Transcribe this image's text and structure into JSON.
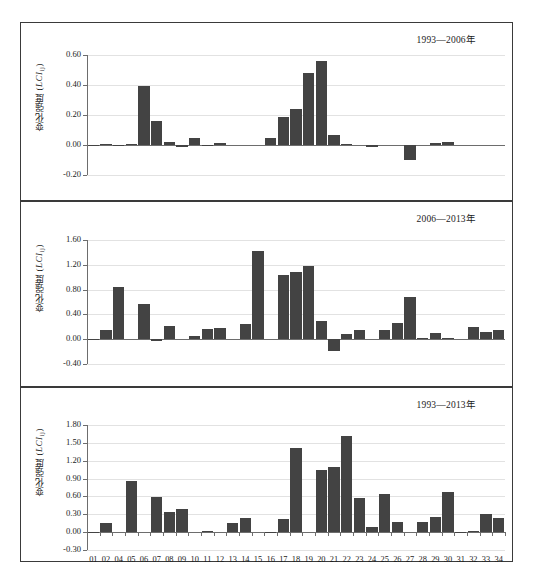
{
  "figure": {
    "ylabel": "变化强度 (LCIij)",
    "ylabel_main": "变化强度 (",
    "ylabel_ital": "LCI",
    "ylabel_sub": "ij",
    "ylabel_end": ")"
  },
  "chart_data": [
    {
      "type": "bar",
      "title": "1993—2006年",
      "xlabel": "",
      "ylabel": "变化强度 (LCIij)",
      "ylim": [
        -0.2,
        0.6
      ],
      "yticks": [
        "0.60",
        "0.40",
        "0.20",
        "0.00",
        "-0.20"
      ],
      "ytick_values": [
        0.6,
        0.4,
        0.2,
        0.0,
        -0.2
      ],
      "grid": true,
      "legend": "none",
      "categories": [
        "01",
        "02",
        "04",
        "05",
        "06",
        "07",
        "08",
        "09",
        "10",
        "11",
        "12",
        "13",
        "14",
        "15",
        "16",
        "17",
        "18",
        "19",
        "20",
        "21",
        "22",
        "23",
        "24",
        "25",
        "26",
        "27",
        "28",
        "29",
        "30",
        "31",
        "32",
        "33",
        "34"
      ],
      "values": [
        -0.002,
        0.006,
        -0.003,
        0.004,
        0.392,
        0.16,
        0.018,
        -0.012,
        0.046,
        -0.004,
        0.012,
        0.0,
        0.0,
        0.0,
        0.05,
        0.185,
        0.24,
        0.48,
        0.557,
        0.068,
        0.004,
        0.0,
        -0.015,
        0.0,
        0.0,
        -0.1,
        0.0,
        0.014,
        0.022,
        0.0,
        0.0,
        0.0,
        0.0
      ]
    },
    {
      "type": "bar",
      "title": "2006—2013年",
      "xlabel": "",
      "ylabel": "变化强度 (LCIij)",
      "ylim": [
        -0.4,
        1.6
      ],
      "yticks": [
        "1.60",
        "1.20",
        "0.80",
        "0.40",
        "0.00",
        "-0.40"
      ],
      "ytick_values": [
        1.6,
        1.2,
        0.8,
        0.4,
        0.0,
        -0.4
      ],
      "grid": true,
      "legend": "none",
      "categories": [
        "01",
        "02",
        "04",
        "05",
        "06",
        "07",
        "08",
        "09",
        "10",
        "11",
        "12",
        "13",
        "14",
        "15",
        "16",
        "17",
        "18",
        "19",
        "20",
        "21",
        "22",
        "23",
        "24",
        "25",
        "26",
        "27",
        "28",
        "29",
        "30",
        "31",
        "32",
        "33",
        "34"
      ],
      "values": [
        -0.01,
        0.145,
        0.845,
        0.0,
        0.575,
        -0.03,
        0.205,
        0.0,
        0.055,
        0.165,
        0.185,
        0.0,
        0.24,
        1.43,
        0.0,
        1.03,
        1.085,
        1.18,
        0.295,
        -0.19,
        0.09,
        0.15,
        0.0,
        0.145,
        0.26,
        0.68,
        0.02,
        0.105,
        0.02,
        0.0,
        0.19,
        0.11,
        0.15
      ]
    },
    {
      "type": "bar",
      "title": "1993—2013年",
      "xlabel": "",
      "ylabel": "变化强度 (LCIij)",
      "ylim": [
        -0.3,
        1.8
      ],
      "yticks": [
        "1.80",
        "1.50",
        "1.20",
        "0.90",
        "0.60",
        "0.30",
        "0.00",
        "-0.30"
      ],
      "ytick_values": [
        1.8,
        1.5,
        1.2,
        0.9,
        0.6,
        0.3,
        0.0,
        -0.3
      ],
      "grid": true,
      "legend": "none",
      "categories": [
        "01",
        "02",
        "04",
        "05",
        "06",
        "07",
        "08",
        "09",
        "10",
        "11",
        "12",
        "13",
        "14",
        "15",
        "16",
        "17",
        "18",
        "19",
        "20",
        "21",
        "22",
        "23",
        "24",
        "25",
        "26",
        "27",
        "28",
        "29",
        "30",
        "31",
        "32",
        "33",
        "34"
      ],
      "values": [
        0.005,
        0.15,
        0.0,
        0.855,
        0.0,
        0.595,
        0.345,
        0.395,
        0.0,
        0.02,
        0.0,
        0.155,
        0.24,
        0.0,
        0.01,
        0.225,
        1.42,
        0.0,
        1.045,
        1.1,
        1.62,
        0.58,
        0.08,
        0.64,
        0.17,
        0.0,
        0.165,
        0.25,
        0.68,
        0.01,
        0.015,
        0.3,
        0.23
      ]
    }
  ]
}
